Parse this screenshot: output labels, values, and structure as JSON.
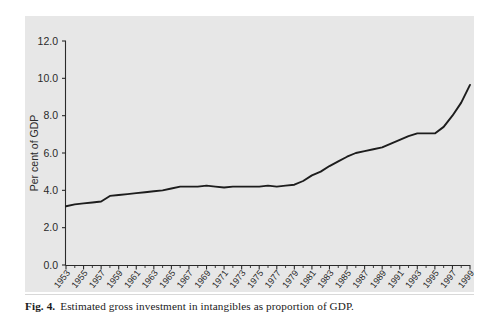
{
  "figure": {
    "caption_label": "Fig. 4.",
    "caption_text": "Estimated gross investment in intangibles as proportion of GDP.",
    "panel_background": "#e7e7e7",
    "line_color": "#1d1d1d"
  },
  "chart_data": {
    "type": "line",
    "title": "",
    "subtitle": "",
    "xlabel": "",
    "ylabel": "Per cent of GDP",
    "ylim": [
      0.0,
      12.0
    ],
    "xlim": [
      1953,
      1999
    ],
    "grid": false,
    "legend": "none",
    "y_ticks": [
      "0.0",
      "2.0",
      "4.0",
      "6.0",
      "8.0",
      "10.0",
      "12.0"
    ],
    "y_tick_values": [
      0.0,
      2.0,
      4.0,
      6.0,
      8.0,
      10.0,
      12.0
    ],
    "x_tick_labels": [
      "1953",
      "1955",
      "1957",
      "1959",
      "1961",
      "1963",
      "1965",
      "1967",
      "1969",
      "1971",
      "1973",
      "1975",
      "1977",
      "1979",
      "1981",
      "1983",
      "1985",
      "1987",
      "1989",
      "1991",
      "1993",
      "1995",
      "1997",
      "1999"
    ],
    "x_tick_values": [
      1953,
      1955,
      1957,
      1959,
      1961,
      1963,
      1965,
      1967,
      1969,
      1971,
      1973,
      1975,
      1977,
      1979,
      1981,
      1983,
      1985,
      1987,
      1989,
      1991,
      1993,
      1995,
      1997,
      1999
    ],
    "x": [
      1953,
      1954,
      1955,
      1956,
      1957,
      1958,
      1959,
      1960,
      1961,
      1962,
      1963,
      1964,
      1965,
      1966,
      1967,
      1968,
      1969,
      1970,
      1971,
      1972,
      1973,
      1974,
      1975,
      1976,
      1977,
      1978,
      1979,
      1980,
      1981,
      1982,
      1983,
      1984,
      1985,
      1986,
      1987,
      1988,
      1989,
      1990,
      1991,
      1992,
      1993,
      1994,
      1995,
      1996,
      1997,
      1998,
      1999
    ],
    "series": [
      {
        "name": "Gross investment in intangibles",
        "values": [
          3.15,
          3.25,
          3.3,
          3.35,
          3.4,
          3.7,
          3.75,
          3.8,
          3.85,
          3.9,
          3.95,
          4.0,
          4.1,
          4.2,
          4.2,
          4.2,
          4.25,
          4.2,
          4.15,
          4.2,
          4.2,
          4.2,
          4.2,
          4.25,
          4.2,
          4.25,
          4.3,
          4.5,
          4.8,
          5.0,
          5.3,
          5.55,
          5.8,
          6.0,
          6.1,
          6.2,
          6.3,
          6.5,
          6.7,
          6.9,
          7.05,
          7.05,
          7.05,
          7.4,
          8.0,
          8.7,
          9.65
        ]
      }
    ]
  }
}
